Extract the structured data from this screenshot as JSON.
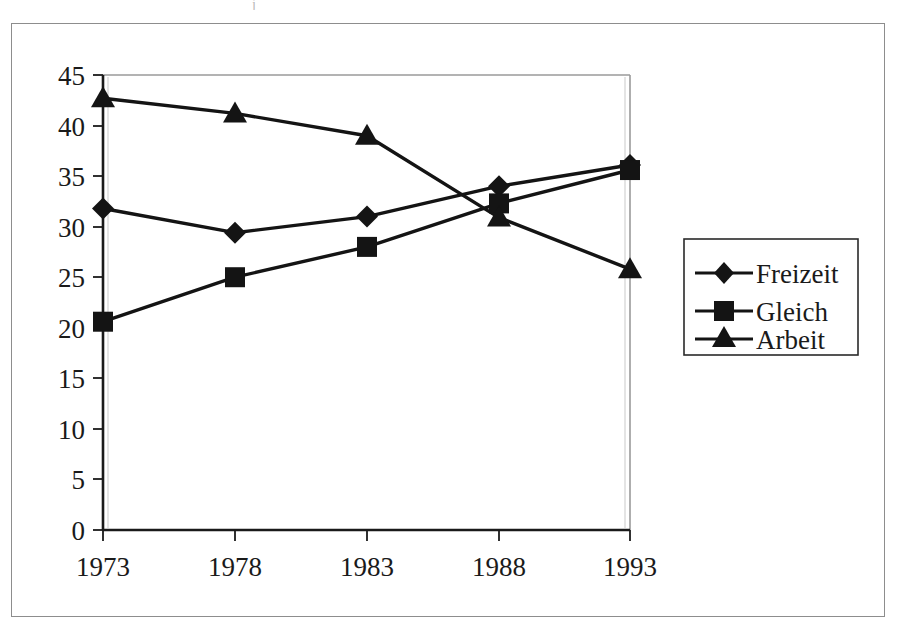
{
  "figure": {
    "kind": "line-chart-scan",
    "background": "#ffffff",
    "frame_color": "#8d8d8d",
    "ink_color": "#141414",
    "axis_color": "#1a1a1a",
    "gridline_color": "#9a9a9a"
  },
  "chart_data": {
    "type": "line",
    "title": "",
    "subtitle": "",
    "xlabel": "",
    "ylabel": "",
    "categories": [
      "1973",
      "1978",
      "1983",
      "1988",
      "1993"
    ],
    "yticks": [
      0,
      5,
      10,
      15,
      20,
      25,
      30,
      35,
      40,
      45
    ],
    "ylim": [
      0,
      45
    ],
    "grid": false,
    "legend_position": "right",
    "series": [
      {
        "name": "Freizeit",
        "marker": "diamond",
        "color": "#141414",
        "values": [
          31.8,
          29.4,
          31.0,
          34.0,
          36.1
        ]
      },
      {
        "name": "Gleich",
        "marker": "square",
        "color": "#141414",
        "values": [
          20.6,
          25.0,
          28.0,
          32.3,
          35.6
        ]
      },
      {
        "name": "Arbeit",
        "marker": "triangle",
        "color": "#141414",
        "values": [
          42.7,
          41.2,
          39.0,
          30.9,
          25.8
        ]
      }
    ]
  },
  "legend": {
    "items": [
      {
        "label": "Freizeit",
        "marker": "diamond-marker-icon"
      },
      {
        "label": "Gleich",
        "marker": "square-marker-icon"
      },
      {
        "label": "Arbeit",
        "marker": "triangle-marker-icon"
      }
    ]
  },
  "axis": {
    "y_tick_labels": [
      "45",
      "40",
      "35",
      "30",
      "25",
      "20",
      "15",
      "10",
      "5",
      "0"
    ],
    "x_tick_labels": [
      "1973",
      "1978",
      "1983",
      "1988",
      "1993"
    ]
  },
  "artifacts": {
    "top_speck": "j"
  }
}
